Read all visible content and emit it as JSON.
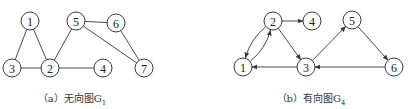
{
  "figure": {
    "graph_a": {
      "caption": "（a）无向图G",
      "caption_sub": "1",
      "directed": false,
      "nodes": [
        {
          "id": "1",
          "label": "1",
          "x": 30,
          "y": 21
        },
        {
          "id": "2",
          "label": "2",
          "x": 50,
          "y": 68
        },
        {
          "id": "3",
          "label": "3",
          "x": 12,
          "y": 68
        },
        {
          "id": "4",
          "label": "4",
          "x": 103,
          "y": 68
        },
        {
          "id": "5",
          "label": "5",
          "x": 76,
          "y": 21
        },
        {
          "id": "6",
          "label": "6",
          "x": 116,
          "y": 23
        },
        {
          "id": "7",
          "label": "7",
          "x": 144,
          "y": 68
        }
      ],
      "edges": [
        [
          "1",
          "3"
        ],
        [
          "1",
          "2"
        ],
        [
          "3",
          "2"
        ],
        [
          "2",
          "4"
        ],
        [
          "2",
          "5"
        ],
        [
          "5",
          "6"
        ],
        [
          "5",
          "7"
        ],
        [
          "6",
          "7"
        ]
      ]
    },
    "graph_b": {
      "caption": "（b）有向图G",
      "caption_sub": "4",
      "directed": true,
      "nodes": [
        {
          "id": "1",
          "label": "1",
          "x": 243,
          "y": 67
        },
        {
          "id": "2",
          "label": "2",
          "x": 273,
          "y": 21
        },
        {
          "id": "3",
          "label": "3",
          "x": 306,
          "y": 67
        },
        {
          "id": "4",
          "label": "4",
          "x": 312,
          "y": 21
        },
        {
          "id": "5",
          "label": "5",
          "x": 352,
          "y": 20
        },
        {
          "id": "6",
          "label": "6",
          "x": 394,
          "y": 67
        }
      ],
      "edges": [
        [
          "2",
          "4"
        ],
        [
          "2",
          "3"
        ],
        [
          "1",
          "2"
        ],
        [
          "2",
          "1"
        ],
        [
          "3",
          "1"
        ],
        [
          "3",
          "5"
        ],
        [
          "5",
          "6"
        ],
        [
          "6",
          "3"
        ]
      ]
    }
  }
}
